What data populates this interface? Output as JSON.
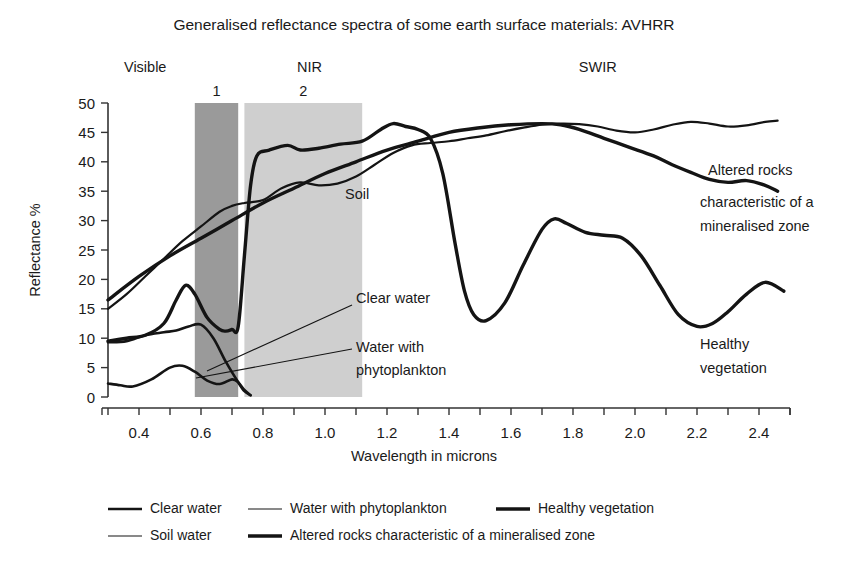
{
  "title": "Generalised reflectance spectra of some earth surface materials: AVHRR",
  "axes": {
    "ylabel": "Reflectance %",
    "xlabel": "Wavelength in microns",
    "y_ticks": [
      "0",
      "5",
      "10",
      "15",
      "20",
      "25",
      "30",
      "35",
      "40",
      "45",
      "50"
    ],
    "x_ticks": [
      "0.4",
      "0.6",
      "0.8",
      "1.0",
      "1.2",
      "1.4",
      "1.6",
      "1.8",
      "2.0",
      "2.2",
      "2.4"
    ]
  },
  "region_labels": [
    {
      "name": "visible",
      "text": "Visible"
    },
    {
      "name": "nir",
      "text": "NIR"
    },
    {
      "name": "swir",
      "text": "SWIR"
    }
  ],
  "band_labels": [
    {
      "name": "band-1",
      "text": "1"
    },
    {
      "name": "band-2",
      "text": "2"
    }
  ],
  "annotations": [
    {
      "name": "soil-label",
      "text": "Soil"
    },
    {
      "name": "clear-water-label",
      "text": "Clear water"
    },
    {
      "name": "water-phytoplankton-label-line1",
      "text": "Water with"
    },
    {
      "name": "water-phytoplankton-label-line2",
      "text": "phytoplankton"
    },
    {
      "name": "altered-rocks-label-line1",
      "text": "Altered rocks"
    },
    {
      "name": "altered-rocks-label-line2",
      "text": "characteristic of a"
    },
    {
      "name": "altered-rocks-label-line3",
      "text": "mineralised zone"
    },
    {
      "name": "healthy-vegetation-label-line1",
      "text": "Healthy"
    },
    {
      "name": "healthy-vegetation-label-line2",
      "text": "vegetation"
    }
  ],
  "legend": [
    {
      "name": "clear-water",
      "text": "Clear water",
      "weight": 2.6
    },
    {
      "name": "water-phytoplankton",
      "text": "Water with phytoplankton",
      "weight": 1.2
    },
    {
      "name": "healthy-vegetation",
      "text": "Healthy vegetation",
      "weight": 3.4
    },
    {
      "name": "soil-water",
      "text": "Soil water",
      "weight": 1.2
    },
    {
      "name": "altered-rocks",
      "text": "Altered rocks characteristic of a mineralised zone",
      "weight": 3.4
    }
  ],
  "colors": {
    "band1": "#9a9a9a",
    "band2": "#cfcfcf",
    "curve": "#141414",
    "axis": "#333333",
    "background": "#ffffff"
  },
  "chart_data": {
    "type": "line",
    "title": "Generalised reflectance spectra of some earth surface materials: AVHRR",
    "xlabel": "Wavelength in microns",
    "ylabel": "Reflectance %",
    "xlim": [
      0.3,
      2.5
    ],
    "ylim": [
      0,
      50
    ],
    "grid": false,
    "legend_position": "bottom",
    "shaded_bands": [
      {
        "label": "1",
        "name": "avhrr-band-1",
        "x_range": [
          0.58,
          0.72
        ],
        "color": "#9a9a9a"
      },
      {
        "label": "2",
        "name": "avhrr-band-2",
        "x_range": [
          0.74,
          1.12
        ],
        "color": "#cfcfcf"
      }
    ],
    "spectral_regions": [
      {
        "label": "Visible",
        "x_center": 0.42
      },
      {
        "label": "NIR",
        "x_center": 0.95
      },
      {
        "label": "SWIR",
        "x_center": 1.88
      }
    ],
    "series": [
      {
        "name": "Healthy vegetation",
        "line_weight": 3.4,
        "x": [
          0.3,
          0.36,
          0.42,
          0.48,
          0.52,
          0.55,
          0.58,
          0.62,
          0.66,
          0.68,
          0.7,
          0.72,
          0.74,
          0.76,
          0.78,
          0.82,
          0.88,
          0.92,
          0.98,
          1.05,
          1.12,
          1.18,
          1.22,
          1.26,
          1.3,
          1.34,
          1.38,
          1.42,
          1.45,
          1.48,
          1.52,
          1.58,
          1.64,
          1.7,
          1.74,
          1.78,
          1.84,
          1.9,
          1.96,
          2.02,
          2.08,
          2.14,
          2.2,
          2.25,
          2.3,
          2.36,
          2.42,
          2.48
        ],
        "y": [
          9.5,
          10.0,
          10.5,
          12.5,
          16.5,
          19.0,
          17.5,
          13.5,
          11.5,
          11.2,
          11.5,
          12.0,
          24.0,
          36.0,
          41.0,
          42.0,
          42.8,
          42.0,
          42.3,
          43.0,
          43.5,
          45.5,
          46.5,
          46.0,
          45.5,
          44.0,
          38.0,
          26.0,
          18.0,
          14.0,
          13.0,
          16.0,
          22.5,
          28.5,
          30.3,
          29.5,
          28.0,
          27.5,
          27.0,
          24.0,
          19.0,
          14.0,
          12.0,
          12.5,
          14.5,
          17.5,
          19.5,
          18.0
        ],
        "note": "Trimmed at right edge near 2.45 descending to about 10.5"
      },
      {
        "name": "Soil water",
        "line_weight": 2.2,
        "x": [
          0.3,
          0.36,
          0.42,
          0.48,
          0.54,
          0.6,
          0.66,
          0.7,
          0.74,
          0.8,
          0.86,
          0.92,
          0.98,
          1.04,
          1.1,
          1.16,
          1.22,
          1.28,
          1.34,
          1.4,
          1.46,
          1.52,
          1.58,
          1.64,
          1.7,
          1.76,
          1.82,
          1.88,
          1.94,
          2.0,
          2.06,
          2.12,
          2.18,
          2.24,
          2.3,
          2.36,
          2.42,
          2.46
        ],
        "y": [
          15.0,
          17.5,
          20.5,
          23.5,
          26.5,
          29.0,
          31.5,
          32.5,
          33.0,
          33.5,
          35.5,
          36.5,
          36.0,
          36.3,
          37.5,
          39.5,
          41.5,
          42.8,
          43.2,
          43.5,
          44.0,
          44.5,
          45.2,
          45.8,
          46.3,
          46.5,
          46.4,
          46.0,
          45.3,
          45.0,
          45.5,
          46.3,
          46.8,
          46.5,
          46.0,
          46.2,
          46.8,
          47.0
        ],
        "note": "Upper wavy curve, shares path with vegetation plateau between 1.2 and 1.35"
      },
      {
        "name": "Altered rocks characteristic of a mineralised zone",
        "line_weight": 3.4,
        "x": [
          0.3,
          0.4,
          0.5,
          0.6,
          0.7,
          0.8,
          0.9,
          1.0,
          1.1,
          1.2,
          1.3,
          1.4,
          1.5,
          1.6,
          1.7,
          1.76,
          1.82,
          1.9,
          1.98,
          2.06,
          2.12,
          2.18,
          2.24,
          2.3,
          2.36,
          2.42,
          2.46
        ],
        "y": [
          16.5,
          20.5,
          24.0,
          27.0,
          30.0,
          33.0,
          35.5,
          38.0,
          40.0,
          42.0,
          43.5,
          45.0,
          45.8,
          46.3,
          46.5,
          46.3,
          45.5,
          44.0,
          42.5,
          41.0,
          39.5,
          38.2,
          37.0,
          36.5,
          36.8,
          36.0,
          35.0
        ],
        "note": "Near straight rising ramp peaking about 1.75 then falling to the right margin label"
      },
      {
        "name": "Clear water",
        "line_weight": 2.6,
        "x": [
          0.3,
          0.36,
          0.42,
          0.48,
          0.52,
          0.56,
          0.6,
          0.64,
          0.68,
          0.72,
          0.74,
          0.76
        ],
        "y": [
          9.3,
          9.5,
          10.5,
          11.0,
          11.3,
          12.0,
          12.3,
          10.0,
          6.0,
          2.5,
          1.0,
          0.3
        ],
        "note": "Falls steeply to zero just past 0.75"
      },
      {
        "name": "Water with phytoplankton",
        "line_weight": 2.6,
        "x": [
          0.3,
          0.34,
          0.38,
          0.44,
          0.5,
          0.54,
          0.58,
          0.62,
          0.66,
          0.7,
          0.72,
          0.74,
          0.76
        ],
        "y": [
          2.3,
          2.0,
          1.8,
          3.0,
          5.0,
          5.3,
          4.3,
          2.8,
          2.2,
          3.0,
          2.5,
          1.2,
          0.3
        ],
        "note": "Lowest curve with a small hump near 0.53 and a second bump near 0.70"
      }
    ]
  }
}
